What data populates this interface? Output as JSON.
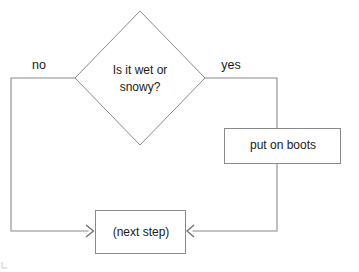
{
  "diagram": {
    "type": "flowchart",
    "background_color": "#ffffff",
    "line_color": "#8a8a8a",
    "text_color": "#1a1a1a",
    "nodes": [
      {
        "id": "decision",
        "shape": "diamond",
        "line1": "Is it wet or",
        "line2": "snowy?",
        "full_text": "Is it wet or snowy?"
      },
      {
        "id": "action",
        "shape": "rectangle",
        "label": "put on boots"
      },
      {
        "id": "next",
        "shape": "rectangle",
        "label": "(next step)"
      }
    ],
    "edges": [
      {
        "id": "edge-no",
        "from": "decision",
        "to": "next",
        "label": "no",
        "direction": "left-then-down-then-right",
        "arrowhead": "open-v-right"
      },
      {
        "id": "edge-yes",
        "from": "decision",
        "to": "action",
        "label": "yes",
        "direction": "right-then-down",
        "arrowhead": "none"
      },
      {
        "id": "edge-action-to-next",
        "from": "action",
        "to": "next",
        "label": "",
        "direction": "down-then-left",
        "arrowhead": "open-v-left"
      }
    ]
  }
}
